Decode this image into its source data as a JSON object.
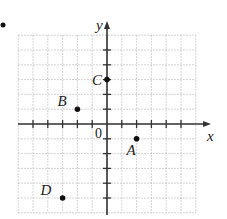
{
  "figure": {
    "bullet": "•",
    "axes": {
      "x_label": "x",
      "y_label": "y",
      "origin_label": "0",
      "x_range": [
        -6,
        6
      ],
      "y_range": [
        -6,
        6
      ]
    },
    "points": [
      {
        "name": "A",
        "x": 2,
        "y": -1
      },
      {
        "name": "B",
        "x": -2,
        "y": 1
      },
      {
        "name": "C",
        "x": 0,
        "y": 3
      },
      {
        "name": "D",
        "x": -3,
        "y": -5
      }
    ],
    "colors": {
      "grid": "#b8b8b8",
      "axis": "#333333",
      "point": "#111111"
    }
  }
}
